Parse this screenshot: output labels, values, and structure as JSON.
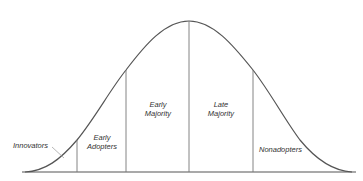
{
  "diagram": {
    "type": "bell-curve",
    "title": "",
    "segments": [
      {
        "id": "innovators",
        "label": "Innovators"
      },
      {
        "id": "early-adopters",
        "label_line1": "Early",
        "label_line2": "Adopters"
      },
      {
        "id": "early-majority",
        "label_line1": "Early",
        "label_line2": "Majority"
      },
      {
        "id": "late-majority",
        "label_line1": "Late",
        "label_line2": "Majority"
      },
      {
        "id": "nonadopters",
        "label": "Nonadopters"
      }
    ],
    "colors": {
      "line": "#555555",
      "text": "#333333",
      "background": "#ffffff"
    }
  }
}
